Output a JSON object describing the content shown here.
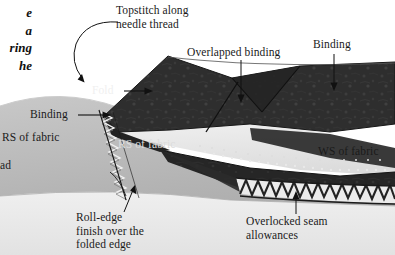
{
  "figure": {
    "kind": "sewing-technique-illustration",
    "width": 395,
    "height": 255
  },
  "body_text": {
    "lines": "e\na\nring\nhe"
  },
  "labels": {
    "topstitch": "Topstitch along\nneedle thread",
    "overlapped_binding": "Overlapped binding",
    "binding_top_right": "Binding",
    "fold": "Fold",
    "binding_left": "Binding",
    "rs_of_fabric_left": "RS of fabric",
    "rs_of_fabric_mid": "RS of fabric",
    "ws_of_fabric": "WS of fabric",
    "thread_clipped": "ad",
    "roll_edge": "Roll-edge\nfinish over the\nfolded edge",
    "overlocked": "Overlocked seam\nallowances"
  },
  "colors": {
    "page_background": "#ffffff",
    "dark_fabric": "#2c2c2c",
    "dark_fabric_shadow": "#1c1c1c",
    "mid_gray_fabric": "#b9b9b9",
    "light_fabric": "#e8e8e8",
    "pale_fabric": "#f1f1f1",
    "stitch_thread": "#f4f4f4",
    "overlock_thread": "#2a2a2a",
    "leader_line": "#111111",
    "label_text": "#1a1a1a"
  }
}
